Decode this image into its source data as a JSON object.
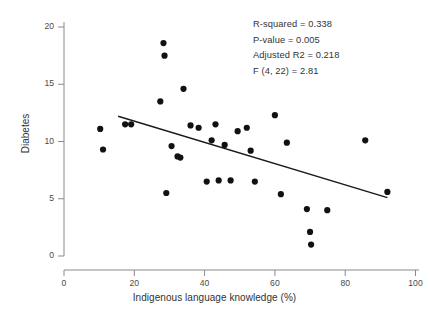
{
  "chart_data": {
    "type": "scatter",
    "title": "",
    "xlabel": "Indigenous language knowledge (%)",
    "ylabel": "Diabetes",
    "xlim": [
      0,
      100
    ],
    "ylim": [
      0,
      20
    ],
    "xticks": [
      0,
      20,
      40,
      60,
      80,
      100
    ],
    "yticks": [
      0,
      5,
      10,
      15,
      20
    ],
    "grid": false,
    "legend": null,
    "marker_color": "#111111",
    "line_color": "#1a1a1a",
    "points": [
      {
        "x": 10.3,
        "y": 11.1
      },
      {
        "x": 11.1,
        "y": 9.3
      },
      {
        "x": 17.4,
        "y": 11.5
      },
      {
        "x": 19.1,
        "y": 11.5
      },
      {
        "x": 27.4,
        "y": 13.5
      },
      {
        "x": 28.3,
        "y": 18.6
      },
      {
        "x": 28.6,
        "y": 17.5
      },
      {
        "x": 29.1,
        "y": 5.5
      },
      {
        "x": 30.6,
        "y": 9.6
      },
      {
        "x": 32.3,
        "y": 8.7
      },
      {
        "x": 33.1,
        "y": 8.6
      },
      {
        "x": 34.0,
        "y": 14.6
      },
      {
        "x": 36.0,
        "y": 11.4
      },
      {
        "x": 38.3,
        "y": 11.2
      },
      {
        "x": 40.6,
        "y": 6.5
      },
      {
        "x": 42.0,
        "y": 10.1
      },
      {
        "x": 43.1,
        "y": 11.5
      },
      {
        "x": 44.0,
        "y": 6.6
      },
      {
        "x": 45.7,
        "y": 9.7
      },
      {
        "x": 47.4,
        "y": 6.6
      },
      {
        "x": 49.4,
        "y": 10.9
      },
      {
        "x": 52.0,
        "y": 11.2
      },
      {
        "x": 53.1,
        "y": 9.2
      },
      {
        "x": 54.3,
        "y": 6.5
      },
      {
        "x": 60.0,
        "y": 12.3
      },
      {
        "x": 61.7,
        "y": 5.4
      },
      {
        "x": 63.4,
        "y": 9.9
      },
      {
        "x": 69.1,
        "y": 4.1
      },
      {
        "x": 70.0,
        "y": 2.1
      },
      {
        "x": 70.3,
        "y": 1.0
      },
      {
        "x": 74.9,
        "y": 4.0
      },
      {
        "x": 85.7,
        "y": 10.1
      },
      {
        "x": 92.0,
        "y": 5.6
      }
    ],
    "trendline": {
      "x_start": 15.4,
      "y_start": 12.2,
      "x_end": 92.0,
      "y_end": 5.1
    },
    "annotations": {
      "r_squared": "R-squared = 0.338",
      "p_value": "P-value = 0.005",
      "adjusted_r2": "Adjusted R2 = 0.218",
      "f_statistic": "F (4, 22) = 2.81"
    }
  }
}
